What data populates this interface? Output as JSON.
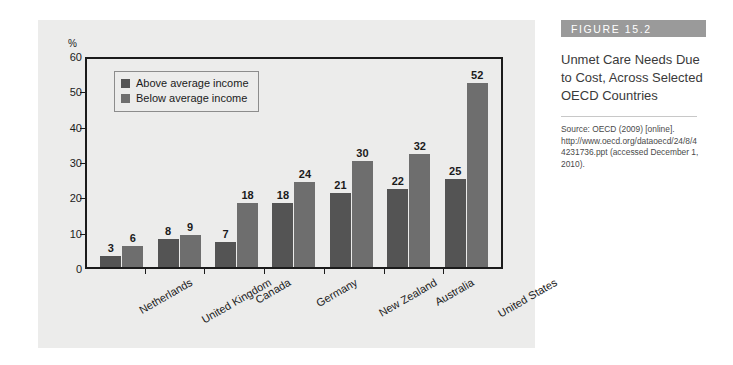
{
  "figure": {
    "label": "FIGURE 15.2",
    "title": "Unmet Care Needs Due to Cost, Across Selected OECD Countries",
    "source": "Source: OECD (2009) [online]. http://www.oecd.org/dataoecd/24/8/44231736.ppt (accessed December 1, 2010)."
  },
  "chart_data": {
    "type": "bar",
    "title": "Unmet Care Needs Due to Cost, Across Selected OECD Countries",
    "xlabel": "",
    "ylabel": "%",
    "ylim": [
      0,
      60
    ],
    "yticks": [
      0,
      10,
      20,
      30,
      40,
      50,
      60
    ],
    "grid": false,
    "legend_position": "top-left-inside",
    "categories": [
      "Netherlands",
      "United Kingdom",
      "Canada",
      "Germany",
      "New Zealand",
      "Australia",
      "United States"
    ],
    "series": [
      {
        "name": "Above average income",
        "color": "#545454",
        "values": [
          3,
          8,
          7,
          18,
          21,
          22,
          25
        ]
      },
      {
        "name": "Below average income",
        "color": "#6e6e6e",
        "values": [
          6,
          9,
          18,
          24,
          30,
          32,
          52
        ]
      }
    ]
  },
  "colors": {
    "panel_background": "#ececeb",
    "axis": "#1b1b1b",
    "figure_bar": "#9a9a9a",
    "above_average": "#545454",
    "below_average": "#6e6e6e"
  }
}
